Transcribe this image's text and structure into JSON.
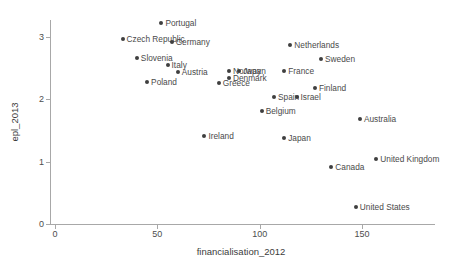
{
  "chart_data": {
    "type": "scatter",
    "title": "",
    "xlabel": "financialisation_2012",
    "ylabel": "epl_2013",
    "xlim": [
      -7,
      188
    ],
    "ylim": [
      -0.07,
      3.28
    ],
    "xticks": [
      0,
      50,
      100,
      150
    ],
    "xtick_labels": [
      "0",
      "50",
      "100",
      "150"
    ],
    "yticks": [
      0,
      1,
      2,
      3
    ],
    "ytick_labels": [
      "0",
      "1",
      "2",
      "3"
    ],
    "grid": false,
    "legend": "none",
    "marker_color": "#3f3f3f",
    "axis_color": "#a8a8a8",
    "text_color": "#4a4a4a",
    "points": [
      {
        "label": "Portugal",
        "x": 52,
        "y": 3.22
      },
      {
        "label": "Czech Republic",
        "x": 33,
        "y": 2.97
      },
      {
        "label": "Germany",
        "x": 57,
        "y": 2.92
      },
      {
        "label": "Slovenia",
        "x": 40,
        "y": 2.66
      },
      {
        "label": "Italy",
        "x": 55,
        "y": 2.55
      },
      {
        "label": "Austria",
        "x": 60,
        "y": 2.44
      },
      {
        "label": "Poland",
        "x": 45,
        "y": 2.28
      },
      {
        "label": "Netherlands",
        "x": 115,
        "y": 2.87
      },
      {
        "label": "Sweden",
        "x": 130,
        "y": 2.65
      },
      {
        "label": "Norway",
        "x": 85,
        "y": 2.46
      },
      {
        "label": "Japan",
        "x": 90,
        "y": 2.46
      },
      {
        "label": "France",
        "x": 112,
        "y": 2.46
      },
      {
        "label": "Denmark",
        "x": 85,
        "y": 2.34
      },
      {
        "label": "Greece",
        "x": 80,
        "y": 2.27
      },
      {
        "label": "Finland",
        "x": 127,
        "y": 2.18
      },
      {
        "label": "Spain",
        "x": 107,
        "y": 2.04
      },
      {
        "label": "Israel",
        "x": 118,
        "y": 2.04
      },
      {
        "label": "Belgium",
        "x": 101,
        "y": 1.81
      },
      {
        "label": "Ireland",
        "x": 73,
        "y": 1.41
      },
      {
        "label": "Japan",
        "x": 112,
        "y": 1.38
      },
      {
        "label": "Australia",
        "x": 149,
        "y": 1.69
      },
      {
        "label": "United Kingdom",
        "x": 157,
        "y": 1.04
      },
      {
        "label": "Canada",
        "x": 135,
        "y": 0.91
      },
      {
        "label": "United States",
        "x": 147,
        "y": 0.27
      }
    ]
  }
}
